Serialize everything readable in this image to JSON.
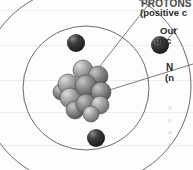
{
  "figure": {
    "background": "#fdfdfd",
    "ruled_line_color": "#ececec",
    "ruled_line_rows": [
      10,
      45,
      80,
      112,
      145
    ]
  },
  "callouts": [
    {
      "id": "protons",
      "heading": "PROTONS",
      "subtext": "(positive c",
      "clipped": true,
      "leader_from": [
        103,
        62
      ],
      "leader_to": [
        150,
        1
      ]
    },
    {
      "id": "outer-shell",
      "heading": "Out",
      "subtext": "in c",
      "clipped": true,
      "leader_from": [
        168,
        40
      ],
      "leader_to": [
        178,
        30
      ]
    },
    {
      "id": "neutrons",
      "heading": "N",
      "subtext": "(n",
      "clipped": true,
      "leader_from": [
        104,
        88
      ],
      "leader_to": [
        180,
        66
      ]
    }
  ],
  "body_text_lines": [
    "A",
    "u",
    "a",
    "s"
  ],
  "atom": {
    "nucleus": {
      "center": [
        86,
        90
      ],
      "particle_count": 11,
      "particle_radius": 11,
      "fill_dark": "#6e6e6e",
      "fill_light": "#9a9a9a",
      "highlight": "#c4c4c4",
      "particles": [
        {
          "cx": 83,
          "cy": 70,
          "r": 10,
          "tone": "light"
        },
        {
          "cx": 68,
          "cy": 84,
          "r": 10,
          "tone": "light"
        },
        {
          "cx": 98,
          "cy": 76,
          "r": 10,
          "tone": "dark"
        },
        {
          "cx": 86,
          "cy": 86,
          "r": 11,
          "tone": "dark"
        },
        {
          "cx": 70,
          "cy": 98,
          "r": 10,
          "tone": "light"
        },
        {
          "cx": 101,
          "cy": 92,
          "r": 10,
          "tone": "dark"
        },
        {
          "cx": 86,
          "cy": 104,
          "r": 10,
          "tone": "dark"
        },
        {
          "cx": 100,
          "cy": 105,
          "r": 9,
          "tone": "light"
        },
        {
          "cx": 75,
          "cy": 110,
          "r": 9,
          "tone": "dark"
        },
        {
          "cx": 91,
          "cy": 114,
          "r": 8,
          "tone": "light"
        },
        {
          "cx": 61,
          "cy": 92,
          "r": 8,
          "tone": "dark"
        }
      ]
    },
    "orbits": [
      {
        "id": "inner-orbit",
        "cx": 86,
        "cy": 88,
        "rx": 63,
        "ry": 62,
        "stroke": "#6b6b6b"
      },
      {
        "id": "outer-orbit",
        "cx": 86,
        "cy": 86,
        "rx": 105,
        "ry": 100,
        "stroke": "#6b6b6b"
      }
    ],
    "electrons": [
      {
        "id": "electron-top-left",
        "cx": 76,
        "cy": 43,
        "r": 9
      },
      {
        "id": "electron-right",
        "cx": 160,
        "cy": 45,
        "r": 9
      },
      {
        "id": "electron-bottom",
        "cx": 96,
        "cy": 138,
        "r": 9
      },
      {
        "color": "#2e2e2e",
        "highlight": "#6d6d6d"
      }
    ],
    "electron_color": "#2f2f2f",
    "electron_highlight": "#707070"
  }
}
